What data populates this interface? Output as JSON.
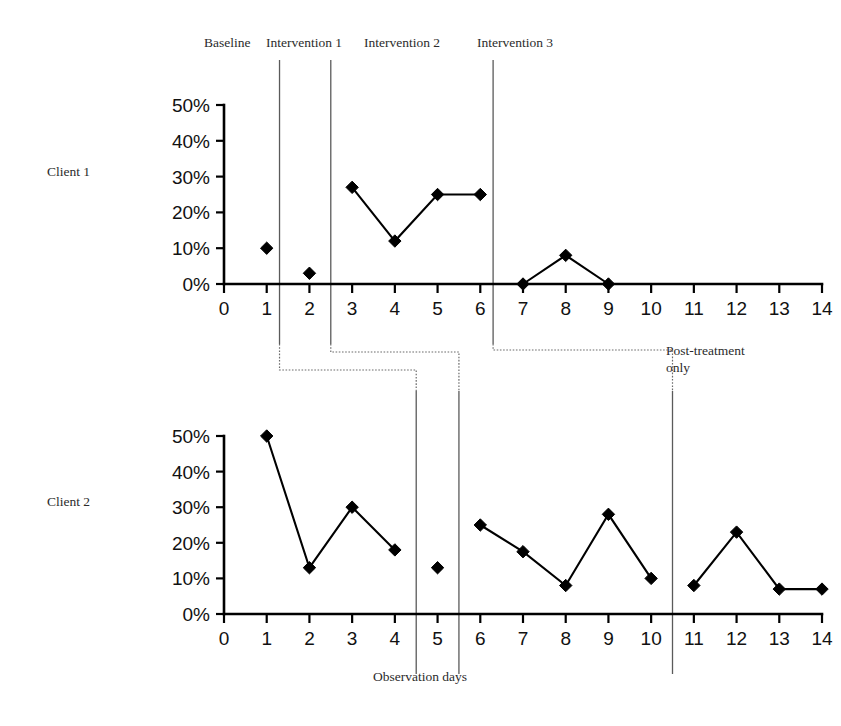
{
  "figure": {
    "client_labels": [
      "Client 1",
      "Client 2"
    ],
    "phase_labels": [
      "Baseline",
      "Intervention 1",
      "Intervention 2",
      "Intervention 3"
    ],
    "note": {
      "line1": "Post-treatment",
      "line2": "only"
    },
    "xlabel": "Observation days"
  },
  "chart_data": [
    {
      "type": "line",
      "title": "Client 1",
      "xlabel": "",
      "ylabel": "",
      "x": [
        1,
        2,
        3,
        4,
        5,
        6,
        7,
        8,
        9
      ],
      "values": [
        10,
        3,
        27,
        12,
        25,
        25,
        0,
        8,
        0
      ],
      "segments": [
        {
          "phase": "Baseline",
          "x": [
            1
          ],
          "values": [
            10
          ]
        },
        {
          "phase": "Intervention 1",
          "x": [
            2
          ],
          "values": [
            3
          ]
        },
        {
          "phase": "Intervention 2",
          "x": [
            3,
            4,
            5,
            6
          ],
          "values": [
            27,
            12,
            25,
            25
          ]
        },
        {
          "phase": "Intervention 3",
          "x": [
            7,
            8,
            9
          ],
          "values": [
            0,
            8,
            0
          ]
        }
      ],
      "xlim": [
        0,
        14
      ],
      "ylim": [
        0,
        50
      ],
      "xticks": [
        0,
        1,
        2,
        3,
        4,
        5,
        6,
        7,
        8,
        9,
        10,
        11,
        12,
        13,
        14
      ],
      "xticklabels": [
        "0",
        "1",
        "2",
        "3",
        "4",
        "5",
        "6",
        "7",
        "8",
        "9",
        "10",
        "11",
        "12",
        "13",
        "14"
      ],
      "yticks": [
        0,
        10,
        20,
        30,
        40,
        50
      ],
      "yticklabels": [
        "0%",
        "10%",
        "20%",
        "30%",
        "40%",
        "50%"
      ],
      "phase_line_x": [
        1.3,
        2.5,
        6.3
      ],
      "grid": false,
      "marker": "diamond",
      "color": "#000000"
    },
    {
      "type": "line",
      "title": "Client 2",
      "xlabel": "Observation days",
      "ylabel": "",
      "x": [
        1,
        2,
        3,
        4,
        5,
        6,
        7,
        8,
        9,
        10,
        11,
        12,
        13,
        14
      ],
      "values": [
        50,
        13,
        30,
        18,
        13,
        25,
        17.5,
        8,
        28,
        10,
        8,
        23,
        7,
        7
      ],
      "segments": [
        {
          "phase": "Baseline",
          "x": [
            1,
            2,
            3,
            4
          ],
          "values": [
            50,
            13,
            30,
            18
          ]
        },
        {
          "phase": "Intervention 1",
          "x": [
            5
          ],
          "values": [
            13
          ]
        },
        {
          "phase": "Intervention 2",
          "x": [
            6,
            7,
            8,
            9,
            10
          ],
          "values": [
            25,
            17.5,
            8,
            28,
            10
          ]
        },
        {
          "phase": "Intervention 3",
          "x": [
            11,
            12,
            13,
            14
          ],
          "values": [
            8,
            23,
            7,
            7
          ]
        }
      ],
      "xlim": [
        0,
        14
      ],
      "ylim": [
        0,
        50
      ],
      "xticks": [
        0,
        1,
        2,
        3,
        4,
        5,
        6,
        7,
        8,
        9,
        10,
        11,
        12,
        13,
        14
      ],
      "xticklabels": [
        "0",
        "1",
        "2",
        "3",
        "4",
        "5",
        "6",
        "7",
        "8",
        "9",
        "10",
        "11",
        "12",
        "13",
        "14"
      ],
      "yticks": [
        0,
        10,
        20,
        30,
        40,
        50
      ],
      "yticklabels": [
        "0%",
        "10%",
        "20%",
        "30%",
        "40%",
        "50%"
      ],
      "phase_line_x": [
        4.5,
        5.5,
        10.5
      ],
      "grid": false,
      "marker": "diamond",
      "color": "#000000"
    }
  ]
}
